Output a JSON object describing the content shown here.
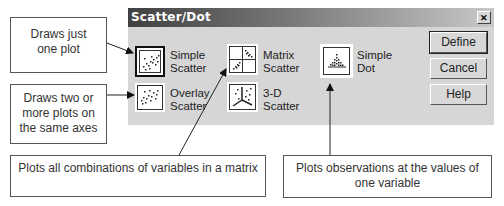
{
  "dialog": {
    "title": "Scatter/Dot",
    "close_glyph": "✕",
    "chart_types": [
      {
        "id": "simple-scatter",
        "line1": "Simple",
        "line2": "Scatter",
        "icon": "simple-scatter-icon",
        "selected": true
      },
      {
        "id": "overlay-scatter",
        "line1": "Overlay",
        "line2": "Scatter",
        "icon": "overlay-scatter-icon",
        "selected": false
      },
      {
        "id": "matrix-scatter",
        "line1": "Matrix",
        "line2": "Scatter",
        "icon": "matrix-scatter-icon",
        "selected": false
      },
      {
        "id": "3d-scatter",
        "line1": "3-D",
        "line2": "Scatter",
        "icon": "3d-scatter-icon",
        "selected": false
      },
      {
        "id": "simple-dot",
        "line1": "Simple",
        "line2": "Dot",
        "icon": "simple-dot-icon",
        "selected": false
      }
    ],
    "buttons": {
      "define": "Define",
      "cancel": "Cancel",
      "help": "Help"
    }
  },
  "callouts": {
    "simple": {
      "line1": "Draws just",
      "line2": "one plot"
    },
    "overlay": {
      "line1": "Draws two or",
      "line2": "more plots on",
      "line3": "the same axes"
    },
    "matrix": {
      "line1": "Plots all combinations of variables in a matrix"
    },
    "dot": {
      "line1": "Plots observations at the values of",
      "line2": "one variable"
    }
  },
  "colors": {
    "dialog_bg": "#d6d6d6",
    "titlebar_start": "#404040",
    "titlebar_end": "#c8c8c8",
    "callout_border": "#555555"
  }
}
